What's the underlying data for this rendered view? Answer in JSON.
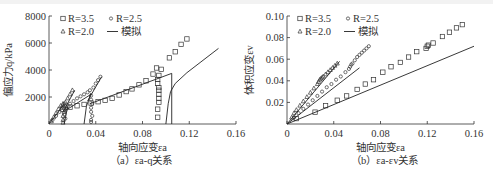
{
  "figure": {
    "panels": [
      {
        "id": "a",
        "caption": "（a）εa-q关系",
        "xlabel": "轴向应变εa",
        "ylabel": "偏应力q/kPa",
        "xticks": [
          "0",
          "0.04",
          "0.08",
          "0.12",
          "0.16"
        ],
        "yticks": [
          "2000",
          "4000",
          "6000",
          "8000"
        ],
        "legend": [
          {
            "marker": "square",
            "label": "R=3.5"
          },
          {
            "marker": "circle",
            "label": "R=2.5"
          },
          {
            "marker": "triangle",
            "label": "R=2.0"
          },
          {
            "marker": "line",
            "label": "模拟"
          }
        ]
      },
      {
        "id": "b",
        "caption": "（b）εa-εv关系",
        "xlabel": "轴向应变εa",
        "ylabel": "体积应变εv",
        "xticks": [
          "0",
          "0.04",
          "0.08",
          "0.12",
          "0.16"
        ],
        "yticks": [
          "0.02",
          "0.04",
          "0.06",
          "0.08",
          "0.10"
        ],
        "legend": [
          {
            "marker": "square",
            "label": "R=3.5"
          },
          {
            "marker": "circle",
            "label": "R=2.5"
          },
          {
            "marker": "triangle",
            "label": "R=2.0"
          },
          {
            "marker": "line",
            "label": "模拟"
          }
        ]
      }
    ]
  },
  "chart_data": [
    {
      "type": "scatter",
      "title": "（a）εa-q关系",
      "xlabel": "轴向应变εa",
      "ylabel": "偏应力q/kPa",
      "xlim": [
        0,
        0.16
      ],
      "ylim": [
        0,
        8000
      ],
      "xticks": [
        0,
        0.04,
        0.08,
        0.12,
        0.16
      ],
      "yticks": [
        2000,
        4000,
        6000,
        8000
      ],
      "grid": false,
      "legend_position": "upper left",
      "series": [
        {
          "name": "R=3.5",
          "marker": "square",
          "x": [
            0.012,
            0.018,
            0.024,
            0.03,
            0.036,
            0.042,
            0.048,
            0.054,
            0.06,
            0.066,
            0.071,
            0.077,
            0.083,
            0.089,
            0.092,
            0.094,
            0.096,
            0.093,
            0.093,
            0.094,
            0.094,
            0.094,
            0.094,
            0.094,
            0.093,
            0.093,
            0.103,
            0.108,
            0.113,
            0.118
          ],
          "y": [
            1100,
            1250,
            1350,
            1450,
            1550,
            1650,
            1750,
            1900,
            2150,
            2400,
            2600,
            2900,
            3200,
            3700,
            4150,
            3600,
            4050,
            3300,
            3000,
            2700,
            2500,
            2200,
            1900,
            1600,
            1100,
            500,
            4900,
            5350,
            5900,
            6300
          ]
        },
        {
          "name": "R=2.5",
          "marker": "circle",
          "x": [
            0.003,
            0.006,
            0.009,
            0.011,
            0.013,
            0.014,
            0.014,
            0.013,
            0.014,
            0.016,
            0.018,
            0.021,
            0.024,
            0.027,
            0.03,
            0.033,
            0.035,
            0.036,
            0.036,
            0.037,
            0.036,
            0.036,
            0.037,
            0.036,
            0.036,
            0.038,
            0.04,
            0.042,
            0.044
          ],
          "y": [
            300,
            600,
            900,
            1200,
            1500,
            1300,
            1000,
            700,
            400,
            1300,
            1500,
            1700,
            1900,
            2050,
            2200,
            2350,
            2500,
            2100,
            1800,
            1500,
            1200,
            900,
            600,
            300,
            150,
            2700,
            3000,
            3250,
            3500
          ]
        },
        {
          "name": "R=2.0",
          "marker": "triangle",
          "x": [
            0.002,
            0.004,
            0.006,
            0.008,
            0.01,
            0.012,
            0.013,
            0.013,
            0.012,
            0.012,
            0.012,
            0.014,
            0.016,
            0.018,
            0.02
          ],
          "y": [
            200,
            500,
            800,
            1100,
            1350,
            1500,
            1200,
            900,
            600,
            300,
            100,
            1600,
            1900,
            2200,
            2500
          ]
        },
        {
          "name": "模拟",
          "marker": "line",
          "segments": [
            {
              "x": [
                0,
                0.008,
                0.013
              ],
              "y": [
                0,
                900,
                1500
              ]
            },
            {
              "x": [
                0.012,
                0.022
              ],
              "y": [
                900,
                2500
              ]
            },
            {
              "x": [
                0.013,
                0.016
              ],
              "y": [
                0,
                1300
              ]
            },
            {
              "x": [
                0.014,
                0.036
              ],
              "y": [
                1000,
                2200
              ]
            },
            {
              "x": [
                0.03,
                0.032,
                0.036
              ],
              "y": [
                0,
                1300,
                2300
              ]
            },
            {
              "x": [
                0.033,
                0.045
              ],
              "y": [
                1700,
                3500
              ]
            },
            {
              "x": [
                0.035,
                0.105
              ],
              "y": [
                1500,
                3750
              ]
            },
            {
              "x": [
                0.105,
                0.105
              ],
              "y": [
                3750,
                0
              ]
            },
            {
              "x": [
                0.1,
                0.102,
                0.104,
                0.108,
                0.118,
                0.13,
                0.145
              ],
              "y": [
                0,
                1500,
                2400,
                3000,
                3800,
                4600,
                5600
              ]
            }
          ]
        }
      ]
    },
    {
      "type": "scatter",
      "title": "（b）εa-εv关系",
      "xlabel": "轴向应变εa",
      "ylabel": "体积应变εv",
      "xlim": [
        0,
        0.16
      ],
      "ylim": [
        0,
        0.1
      ],
      "xticks": [
        0,
        0.04,
        0.08,
        0.12,
        0.16
      ],
      "yticks": [
        0.02,
        0.04,
        0.06,
        0.08,
        0.1
      ],
      "grid": false,
      "legend_position": "upper left",
      "series": [
        {
          "name": "R=3.5",
          "marker": "square",
          "x": [
            0.008,
            0.024,
            0.033,
            0.043,
            0.051,
            0.06,
            0.067,
            0.074,
            0.082,
            0.089,
            0.097,
            0.104,
            0.111,
            0.119,
            0.12,
            0.121,
            0.125,
            0.133,
            0.139,
            0.145,
            0.15
          ],
          "y": [
            0.005,
            0.011,
            0.017,
            0.022,
            0.026,
            0.032,
            0.037,
            0.041,
            0.048,
            0.053,
            0.057,
            0.062,
            0.067,
            0.07,
            0.072,
            0.073,
            0.075,
            0.081,
            0.085,
            0.089,
            0.092
          ]
        },
        {
          "name": "R=2.5",
          "marker": "circle",
          "x": [
            0.006,
            0.01,
            0.014,
            0.018,
            0.022,
            0.026,
            0.03,
            0.034,
            0.038,
            0.042,
            0.046,
            0.05,
            0.053,
            0.054,
            0.055,
            0.056,
            0.058,
            0.06,
            0.062,
            0.064,
            0.066,
            0.068,
            0.07
          ],
          "y": [
            0.006,
            0.01,
            0.014,
            0.018,
            0.022,
            0.026,
            0.03,
            0.034,
            0.037,
            0.041,
            0.044,
            0.048,
            0.051,
            0.053,
            0.055,
            0.056,
            0.059,
            0.062,
            0.064,
            0.066,
            0.068,
            0.07,
            0.072
          ]
        },
        {
          "name": "R=2.0",
          "marker": "triangle",
          "x": [
            0.004,
            0.006,
            0.008,
            0.011,
            0.014,
            0.017,
            0.02,
            0.023,
            0.026,
            0.027,
            0.028,
            0.029,
            0.03,
            0.031,
            0.033,
            0.035,
            0.037,
            0.039,
            0.041,
            0.043
          ],
          "y": [
            0.006,
            0.01,
            0.013,
            0.017,
            0.021,
            0.025,
            0.029,
            0.033,
            0.037,
            0.039,
            0.041,
            0.042,
            0.043,
            0.044,
            0.046,
            0.048,
            0.05,
            0.052,
            0.054,
            0.056
          ]
        },
        {
          "name": "模拟",
          "marker": "line",
          "segments": [
            {
              "x": [
                0,
                0.045
              ],
              "y": [
                0,
                0.058
              ]
            },
            {
              "x": [
                0,
                0.062
              ],
              "y": [
                0,
                0.052
              ]
            },
            {
              "x": [
                0,
                0.16
              ],
              "y": [
                0,
                0.072
              ]
            }
          ]
        }
      ]
    }
  ]
}
